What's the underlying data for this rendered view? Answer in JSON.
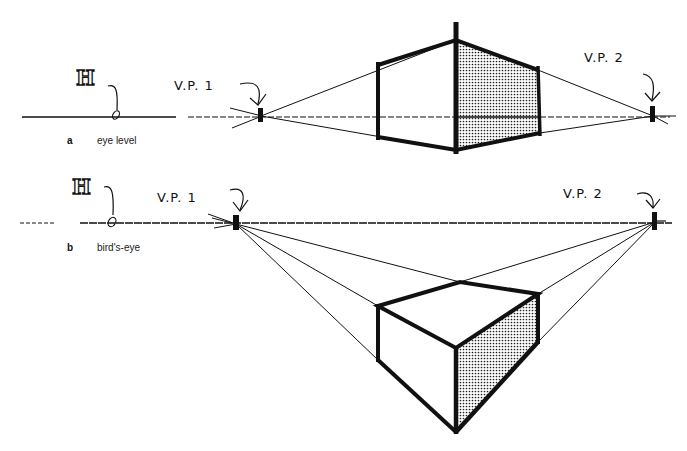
{
  "panels": [
    {
      "letter": "a",
      "caption": "eye level",
      "horizon_label": "H",
      "vp1_label": "V.P. 1",
      "vp2_label": "V.P. 2"
    },
    {
      "letter": "b",
      "caption": "bird's-eye",
      "horizon_label": "H",
      "vp1_label": "V.P. 1",
      "vp2_label": "V.P. 2"
    }
  ],
  "colors": {
    "ink": "#111111",
    "shade": "#555555",
    "paper": "#ffffff"
  }
}
